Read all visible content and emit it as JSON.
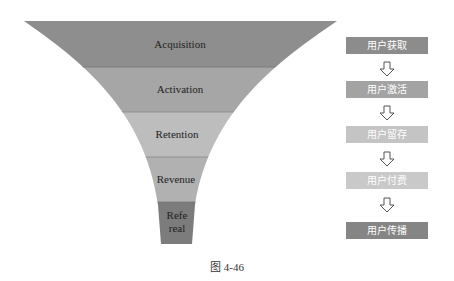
{
  "funnel": {
    "stages": [
      {
        "label": "Acquisition",
        "color": "#8e8e8e"
      },
      {
        "label": "Activation",
        "color": "#a6a6a6"
      },
      {
        "label": "Retention",
        "color": "#bdbdbd"
      },
      {
        "label": "Revenue",
        "color": "#b1b1b1"
      },
      {
        "label_line1": "Refe",
        "label_line2": "real",
        "color": "#7c7c7c"
      }
    ]
  },
  "steps": [
    {
      "label": "用户获取",
      "color": "#8c8c8c"
    },
    {
      "label": "用户激活",
      "color": "#a3a3a3"
    },
    {
      "label": "用户留存",
      "color": "#c4c4c4"
    },
    {
      "label": "用户付费",
      "color": "#c9c9c9"
    },
    {
      "label": "用户传播",
      "color": "#858585"
    }
  ],
  "arrow_icon": "down-arrow-outline",
  "caption": "图 4-46"
}
